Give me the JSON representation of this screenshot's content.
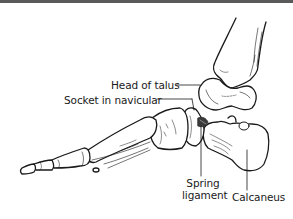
{
  "figure": {
    "labels": {
      "head_of_talus": "Head of talus",
      "socket_in_navicular": "Socket in navicular",
      "spring_ligament_line1": "Spring",
      "spring_ligament_line2": "ligament",
      "calcaneus": "Calcaneus"
    },
    "colors": {
      "ink": "#1a1a1a",
      "border": "#5a5a5a",
      "background": "#ffffff",
      "ligament_shade": "#3a3a3a"
    }
  }
}
